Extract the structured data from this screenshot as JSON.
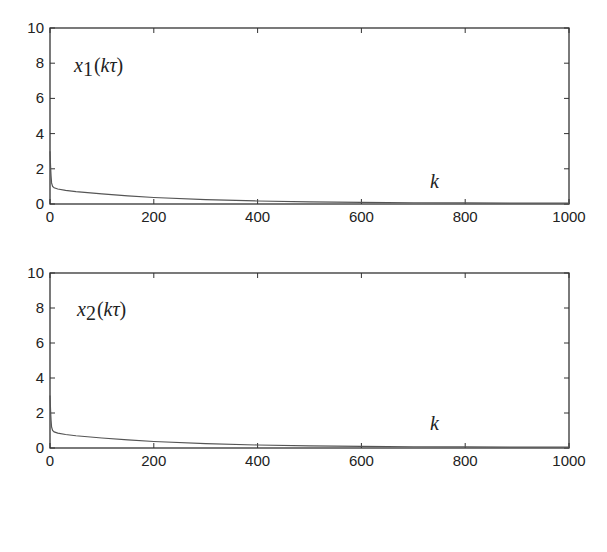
{
  "chart_data": [
    {
      "type": "line",
      "title": "",
      "annotation": "x1(kτ)",
      "annotation_parts": {
        "var": "x",
        "sub": "1",
        "open": "(",
        "arg": "kτ",
        "close": ")"
      },
      "xlabel": "k",
      "ylabel": "",
      "xlim": [
        0,
        1000
      ],
      "ylim": [
        0,
        10
      ],
      "xticks": [
        "0",
        "200",
        "400",
        "600",
        "800",
        "1000"
      ],
      "yticks": [
        "0",
        "2",
        "4",
        "6",
        "8",
        "10"
      ],
      "grid": false,
      "legend": null,
      "series": [
        {
          "name": "x1(kτ)",
          "x": [
            0,
            1,
            2,
            3,
            5,
            8,
            15,
            30,
            50,
            100,
            150,
            200,
            300,
            400,
            500,
            600,
            700,
            800,
            900,
            1000
          ],
          "y": [
            3.0,
            2.2,
            1.6,
            1.2,
            1.0,
            0.92,
            0.85,
            0.77,
            0.7,
            0.57,
            0.46,
            0.37,
            0.25,
            0.17,
            0.12,
            0.09,
            0.07,
            0.06,
            0.05,
            0.05
          ]
        }
      ]
    },
    {
      "type": "line",
      "title": "",
      "annotation": "x2(kτ)",
      "annotation_parts": {
        "var": "x",
        "sub": "2",
        "open": "(",
        "arg": "kτ",
        "close": ")"
      },
      "xlabel": "k",
      "ylabel": "",
      "xlim": [
        0,
        1000
      ],
      "ylim": [
        0,
        10
      ],
      "xticks": [
        "0",
        "200",
        "400",
        "600",
        "800",
        "1000"
      ],
      "yticks": [
        "0",
        "2",
        "4",
        "6",
        "8",
        "10"
      ],
      "grid": false,
      "legend": null,
      "series": [
        {
          "name": "x2(kτ)",
          "x": [
            0,
            1,
            2,
            3,
            5,
            8,
            15,
            30,
            50,
            100,
            150,
            200,
            300,
            400,
            500,
            600,
            700,
            800,
            900,
            1000
          ],
          "y": [
            3.0,
            2.2,
            1.6,
            1.2,
            1.0,
            0.92,
            0.85,
            0.77,
            0.7,
            0.57,
            0.46,
            0.37,
            0.25,
            0.17,
            0.12,
            0.09,
            0.07,
            0.06,
            0.05,
            0.05
          ]
        }
      ]
    }
  ],
  "colors": {
    "axis": "#333333",
    "line": "#555555",
    "text": "#222222"
  }
}
